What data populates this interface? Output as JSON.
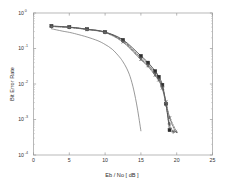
{
  "chart_data": {
    "type": "line",
    "title": "",
    "xlabel": "Eb / No [ dB ]",
    "ylabel": "Bit Error Rate",
    "xlim": [
      0,
      25
    ],
    "ylim": [
      0.0001,
      1
    ],
    "yscale": "log",
    "grid": false,
    "legend": "none",
    "xticks": [
      "0",
      "5",
      "10",
      "15",
      "20",
      "25"
    ],
    "xtick_values": [
      0,
      5,
      10,
      15,
      20,
      25
    ],
    "ytick_labels": [
      "10",
      "10",
      "10",
      "10",
      "10"
    ],
    "ytick_exponents": [
      "0",
      "-1",
      "-2",
      "-3",
      "-4"
    ],
    "ytick_values": [
      1,
      0.1,
      0.01,
      0.001,
      0.0001
    ],
    "series": [
      {
        "name": "uncoded",
        "marker": "none",
        "linestyle": "solid",
        "color": "#777777",
        "x": [
          2.5,
          4,
          5,
          6,
          7.5,
          9,
          10,
          11,
          12,
          12.5,
          13,
          13.5,
          14,
          14.5,
          15
        ],
        "y": [
          0.36,
          0.31,
          0.285,
          0.255,
          0.21,
          0.165,
          0.13,
          0.095,
          0.058,
          0.042,
          0.028,
          0.016,
          0.0068,
          0.0021,
          0.00048
        ]
      },
      {
        "name": "curve-1",
        "marker": "square",
        "linestyle": "solid",
        "color": "#2a2a2a",
        "x": [
          2.5,
          5,
          7.5,
          10,
          12.5,
          15,
          16,
          17,
          17.5,
          18,
          18.5,
          19
        ],
        "y": [
          0.43,
          0.4,
          0.35,
          0.29,
          0.175,
          0.062,
          0.04,
          0.023,
          0.016,
          0.0095,
          0.0028,
          0.0005
        ]
      },
      {
        "name": "curve-2",
        "marker": "plus",
        "linestyle": "dashed",
        "color": "#4a4a4a",
        "x": [
          2.5,
          5,
          7.5,
          10,
          12.5,
          15,
          16,
          17,
          17.5,
          18,
          18.5,
          19,
          19.5
        ],
        "y": [
          0.42,
          0.395,
          0.345,
          0.285,
          0.165,
          0.055,
          0.036,
          0.02,
          0.014,
          0.0082,
          0.0026,
          0.00075,
          0.00045
        ]
      },
      {
        "name": "curve-3",
        "marker": "cross",
        "linestyle": "dotted",
        "color": "#5a5a5a",
        "x": [
          2.5,
          5,
          7.5,
          10,
          12.5,
          15,
          16,
          17,
          17.5,
          18,
          18.5,
          19,
          19.8
        ],
        "y": [
          0.425,
          0.4,
          0.348,
          0.29,
          0.155,
          0.05,
          0.033,
          0.018,
          0.013,
          0.0078,
          0.0032,
          0.0011,
          0.00046
        ]
      },
      {
        "name": "curve-4",
        "marker": "point",
        "linestyle": "dashdot",
        "color": "#6a6a6a",
        "x": [
          2.5,
          5,
          7.5,
          10,
          12.5,
          15,
          16,
          17,
          17.5,
          18,
          18.5,
          19,
          20
        ],
        "y": [
          0.415,
          0.39,
          0.34,
          0.28,
          0.15,
          0.048,
          0.031,
          0.017,
          0.0125,
          0.0072,
          0.003,
          0.0012,
          0.00044
        ]
      }
    ]
  }
}
